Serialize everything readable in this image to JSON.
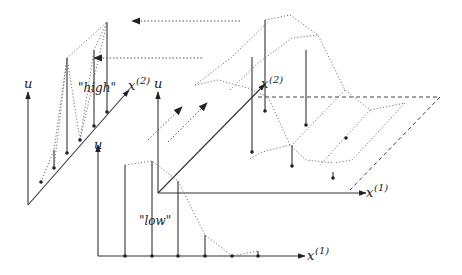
{
  "figure": {
    "colors": {
      "ink": "#222222",
      "dotted": "#666666",
      "background": "#ffffff"
    }
  },
  "panels": {
    "high": {
      "quote_label": "\"high\"",
      "u_axis_label": "u",
      "x_axis_label": "x",
      "x_axis_superscript": "(2)"
    },
    "surface": {
      "u_axis_label": "u",
      "x1_axis_label": "x",
      "x1_axis_superscript": "(1)",
      "x2_axis_label": "x",
      "x2_axis_superscript": "(2)"
    },
    "low": {
      "quote_label": "\"low\"",
      "u_axis_label": "u",
      "x_axis_label": "x",
      "x_axis_superscript": "(1)"
    }
  },
  "arrows": {
    "projection_to_high": [
      "upper-left dotted arrow",
      "lower-left dotted arrow"
    ],
    "projection_from_low": [
      "left diagonal dotted arrow",
      "right diagonal dotted arrow"
    ]
  }
}
